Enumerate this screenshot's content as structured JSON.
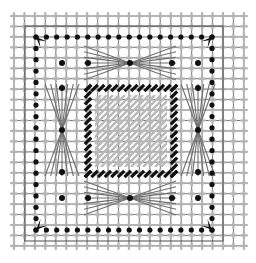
{
  "figure": {
    "canvas": {
      "width": 256,
      "height": 263,
      "background": "#ffffff"
    }
  },
  "colors": {
    "grid_line": "#4d4d4d",
    "node_marker": "#b3b3b3",
    "black_dot": "#111111",
    "hatch": "#b9b9b9",
    "dash_border": "#111111",
    "bowtie_curve": "#6f6f6f",
    "arrow": "#111111",
    "background": "#ffffff"
  },
  "grid": {
    "label": "background-lattice",
    "x0": 14,
    "y0": 16,
    "spacing": 10.45,
    "cols": 22,
    "rows": 22,
    "line_width": 0.8,
    "node_marker_shape": "plus-cross",
    "node_marker_size": 6,
    "node_marker_thickness": 2.2
  },
  "hatch_region": {
    "label": "central-hatched-domain",
    "x": 95,
    "y": 95,
    "width": 72,
    "height": 72,
    "angle_deg": 45,
    "line_spacing": 6,
    "line_width": 2.4
  },
  "dash_border": {
    "label": "inner-dashed-boundary",
    "x": 88,
    "y": 88,
    "width": 86,
    "height": 86,
    "dash_count_per_side": 13,
    "dash_length": 9,
    "dash_thickness": 3.2,
    "dash_angle_deg": 45
  },
  "boundary_dots": {
    "label": "constrained-boundary-nodes",
    "radius": 2.6,
    "top_row_y": 37,
    "bottom_row_y": 230,
    "left_col_x": 36,
    "right_col_x": 212,
    "edge_dot_count": 18
  },
  "interior_dots": {
    "label": "interior-marked-nodes",
    "radius": 3.0,
    "points": [
      [
        62,
        63
      ],
      [
        88,
        63
      ],
      [
        130,
        63
      ],
      [
        172,
        63
      ],
      [
        198,
        63
      ],
      [
        62,
        88
      ],
      [
        198,
        88
      ],
      [
        62,
        130
      ],
      [
        198,
        130
      ],
      [
        62,
        172
      ],
      [
        198,
        172
      ],
      [
        62,
        198
      ],
      [
        88,
        198
      ],
      [
        130,
        198
      ],
      [
        172,
        198
      ],
      [
        198,
        198
      ]
    ]
  },
  "bowties": {
    "label": "fan-line-bundles",
    "line_width": 1.1,
    "items": [
      {
        "name": "bowtie-top",
        "cx": 130,
        "cy": 63,
        "orientation": "horizontal",
        "span": 46,
        "spread": 17
      },
      {
        "name": "bowtie-bottom",
        "cx": 130,
        "cy": 198,
        "orientation": "horizontal",
        "span": 46,
        "spread": 17
      },
      {
        "name": "bowtie-left",
        "cx": 62,
        "cy": 130,
        "orientation": "vertical",
        "span": 46,
        "spread": 17
      },
      {
        "name": "bowtie-right",
        "cx": 198,
        "cy": 130,
        "orientation": "vertical",
        "span": 46,
        "spread": 17
      }
    ]
  },
  "corner_supports": {
    "label": "corner-arrow-supports",
    "size": 11,
    "items": [
      {
        "name": "corner-arrow-top-left",
        "x": 36,
        "y": 37,
        "rotation": 45
      },
      {
        "name": "corner-arrow-top-right",
        "x": 212,
        "y": 37,
        "rotation": 135
      },
      {
        "name": "corner-arrow-bottom-left",
        "x": 36,
        "y": 230,
        "rotation": -45
      },
      {
        "name": "corner-arrow-bottom-right",
        "x": 212,
        "y": 230,
        "rotation": -135
      }
    ]
  },
  "frame": {
    "label": "outer-mesh-frame",
    "x": 25,
    "y": 26,
    "width": 198,
    "height": 215,
    "line_width": 1.0
  }
}
